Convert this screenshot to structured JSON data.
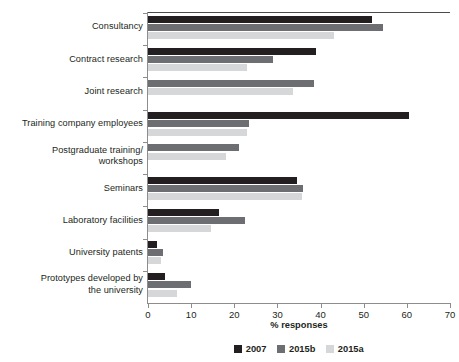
{
  "chart_data": {
    "type": "bar",
    "orientation": "horizontal",
    "title": "",
    "xlabel": "% responses",
    "ylabel": "",
    "xlim": [
      0,
      70
    ],
    "xticks": [
      0,
      10,
      20,
      30,
      40,
      50,
      60,
      70
    ],
    "grid": false,
    "legend_position": "bottom",
    "categories": [
      "Consultancy",
      "Contract research",
      "Joint research",
      "Training company employees",
      "Postgraduate training/\nworkshops",
      "Seminars",
      "Laboratory facilities",
      "University patents",
      "Prototypes developed by\nthe university"
    ],
    "series": [
      {
        "name": "2007",
        "color": "#231f20",
        "values": [
          52,
          39,
          0,
          60.5,
          0,
          34.5,
          16.5,
          2,
          4
        ]
      },
      {
        "name": "2015b",
        "color": "#6d6e71",
        "values": [
          54.5,
          29,
          38.5,
          23.3,
          21,
          36,
          22.5,
          3.5,
          10
        ]
      },
      {
        "name": "2015a",
        "color": "#d6d7d8",
        "values": [
          43,
          23,
          33.5,
          23,
          18,
          35.7,
          14.5,
          3,
          6.7
        ]
      }
    ]
  },
  "axis": {
    "x_title": "% responses",
    "tick_labels": [
      "0",
      "10",
      "20",
      "30",
      "40",
      "50",
      "60",
      "70"
    ]
  },
  "categories": {
    "0": {
      "line1": "Consultancy",
      "line2": ""
    },
    "1": {
      "line1": "Contract research",
      "line2": ""
    },
    "2": {
      "line1": "Joint research",
      "line2": ""
    },
    "3": {
      "line1": "Training company employees",
      "line2": ""
    },
    "4": {
      "line1": "Postgraduate training/",
      "line2": "workshops"
    },
    "5": {
      "line1": "Seminars",
      "line2": ""
    },
    "6": {
      "line1": "Laboratory facilities",
      "line2": ""
    },
    "7": {
      "line1": "University patents",
      "line2": ""
    },
    "8": {
      "line1": "Prototypes developed by",
      "line2": "the university"
    }
  },
  "legend": {
    "items": [
      {
        "label": "2007",
        "color": "#231f20"
      },
      {
        "label": "2015b",
        "color": "#6d6e71"
      },
      {
        "label": "2015a",
        "color": "#d6d7d8"
      }
    ]
  },
  "colors": {
    "series_2007": "#231f20",
    "series_2015b": "#6d6e71",
    "series_2015a": "#d6d7d8",
    "axis": "#8d8d8d",
    "text": "#231f20",
    "background": "#ffffff"
  }
}
